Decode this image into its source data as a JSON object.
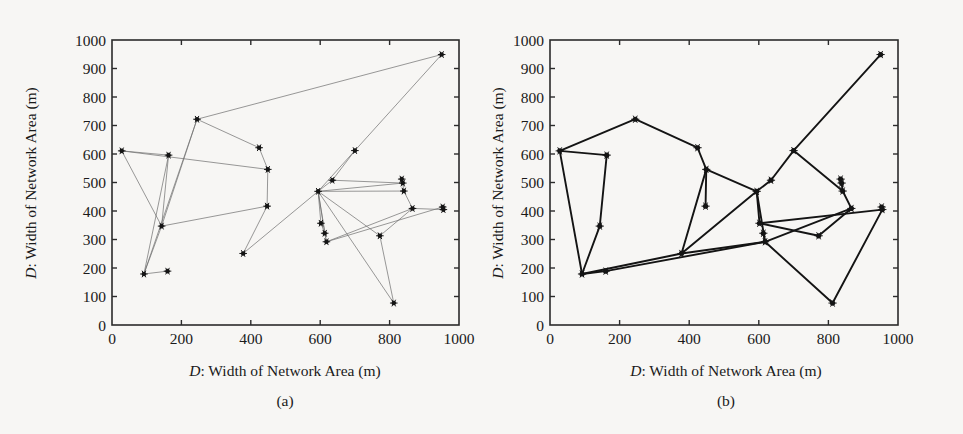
{
  "figure": {
    "background_color": "#f7f6f4",
    "ink_color": "#1a1a1a"
  },
  "panels": [
    {
      "id": "a",
      "caption": "(a)",
      "xlabel_prefix": "D",
      "xlabel_rest": ": Width of Network Area (m)",
      "ylabel_prefix": "D",
      "ylabel_rest": ": Width of Network Area (m)",
      "xticks": [
        "0",
        "200",
        "400",
        "600",
        "800",
        "1000"
      ],
      "yticks": [
        "0",
        "100",
        "200",
        "300",
        "400",
        "500",
        "600",
        "700",
        "800",
        "900",
        "1000"
      ]
    },
    {
      "id": "b",
      "caption": "(b)",
      "xlabel_prefix": "D",
      "xlabel_rest": ": Width of Network Area (m)",
      "ylabel_prefix": "D",
      "ylabel_rest": ": Width of Network Area (m)",
      "xticks": [
        "0",
        "200",
        "400",
        "600",
        "800",
        "1000"
      ],
      "yticks": [
        "0",
        "100",
        "200",
        "300",
        "400",
        "500",
        "600",
        "700",
        "800",
        "900",
        "1000"
      ]
    }
  ],
  "chart_data": [
    {
      "type": "scatter",
      "panel": "a",
      "title": "(a)",
      "xlabel": "D: Width of Network Area (m)",
      "ylabel": "D: Width of Network Area (m)",
      "xlim": [
        0,
        1000
      ],
      "ylim": [
        0,
        1000
      ],
      "xticks": [
        0,
        200,
        400,
        600,
        800,
        1000
      ],
      "yticks": [
        0,
        100,
        200,
        300,
        400,
        500,
        600,
        700,
        800,
        900,
        1000
      ],
      "grid": false,
      "legend": null,
      "marker": "star-dot",
      "edge_style": "thin-gray",
      "nodes": [
        {
          "id": 0,
          "x": 28,
          "y": 611
        },
        {
          "id": 1,
          "x": 163,
          "y": 596
        },
        {
          "id": 2,
          "x": 143,
          "y": 347
        },
        {
          "id": 3,
          "x": 92,
          "y": 179
        },
        {
          "id": 4,
          "x": 160,
          "y": 189
        },
        {
          "id": 5,
          "x": 245,
          "y": 722
        },
        {
          "id": 6,
          "x": 424,
          "y": 622
        },
        {
          "id": 7,
          "x": 449,
          "y": 546
        },
        {
          "id": 8,
          "x": 447,
          "y": 417
        },
        {
          "id": 9,
          "x": 378,
          "y": 251
        },
        {
          "id": 10,
          "x": 594,
          "y": 469
        },
        {
          "id": 11,
          "x": 635,
          "y": 508
        },
        {
          "id": 12,
          "x": 700,
          "y": 612
        },
        {
          "id": 13,
          "x": 835,
          "y": 512
        },
        {
          "id": 14,
          "x": 838,
          "y": 498
        },
        {
          "id": 15,
          "x": 841,
          "y": 470
        },
        {
          "id": 16,
          "x": 953,
          "y": 414
        },
        {
          "id": 17,
          "x": 955,
          "y": 405
        },
        {
          "id": 18,
          "x": 866,
          "y": 409
        },
        {
          "id": 19,
          "x": 772,
          "y": 313
        },
        {
          "id": 20,
          "x": 602,
          "y": 357
        },
        {
          "id": 21,
          "x": 613,
          "y": 322
        },
        {
          "id": 22,
          "x": 618,
          "y": 292
        },
        {
          "id": 23,
          "x": 812,
          "y": 77
        },
        {
          "id": 24,
          "x": 950,
          "y": 949
        }
      ],
      "edges": [
        [
          0,
          1
        ],
        [
          0,
          2
        ],
        [
          0,
          7
        ],
        [
          1,
          3
        ],
        [
          1,
          2
        ],
        [
          2,
          3
        ],
        [
          2,
          8
        ],
        [
          3,
          4
        ],
        [
          5,
          24
        ],
        [
          5,
          3
        ],
        [
          5,
          2
        ],
        [
          5,
          6
        ],
        [
          6,
          7
        ],
        [
          7,
          8
        ],
        [
          8,
          9
        ],
        [
          9,
          10
        ],
        [
          10,
          11
        ],
        [
          10,
          12
        ],
        [
          10,
          14
        ],
        [
          10,
          15
        ],
        [
          10,
          19
        ],
        [
          10,
          20
        ],
        [
          10,
          21
        ],
        [
          10,
          22
        ],
        [
          10,
          23
        ],
        [
          11,
          12
        ],
        [
          11,
          14
        ],
        [
          12,
          24
        ],
        [
          13,
          14
        ],
        [
          14,
          15
        ],
        [
          15,
          18
        ],
        [
          16,
          17
        ],
        [
          17,
          18
        ],
        [
          18,
          19
        ],
        [
          18,
          22
        ],
        [
          19,
          23
        ],
        [
          20,
          21
        ],
        [
          21,
          22
        ],
        [
          22,
          16
        ]
      ]
    },
    {
      "type": "scatter",
      "panel": "b",
      "title": "(b)",
      "xlabel": "D: Width of Network Area (m)",
      "ylabel": "D: Width of Network Area (m)",
      "xlim": [
        0,
        1000
      ],
      "ylim": [
        0,
        1000
      ],
      "xticks": [
        0,
        200,
        400,
        600,
        800,
        1000
      ],
      "yticks": [
        0,
        100,
        200,
        300,
        400,
        500,
        600,
        700,
        800,
        900,
        1000
      ],
      "grid": false,
      "legend": null,
      "marker": "star-dot",
      "edge_style": "thick-black",
      "nodes": [
        {
          "id": 0,
          "x": 28,
          "y": 611
        },
        {
          "id": 1,
          "x": 163,
          "y": 596
        },
        {
          "id": 2,
          "x": 143,
          "y": 347
        },
        {
          "id": 3,
          "x": 92,
          "y": 179
        },
        {
          "id": 4,
          "x": 160,
          "y": 189
        },
        {
          "id": 5,
          "x": 245,
          "y": 722
        },
        {
          "id": 6,
          "x": 424,
          "y": 622
        },
        {
          "id": 7,
          "x": 449,
          "y": 546
        },
        {
          "id": 8,
          "x": 447,
          "y": 417
        },
        {
          "id": 9,
          "x": 378,
          "y": 251
        },
        {
          "id": 10,
          "x": 594,
          "y": 469
        },
        {
          "id": 11,
          "x": 635,
          "y": 508
        },
        {
          "id": 12,
          "x": 700,
          "y": 612
        },
        {
          "id": 13,
          "x": 835,
          "y": 512
        },
        {
          "id": 14,
          "x": 838,
          "y": 498
        },
        {
          "id": 15,
          "x": 841,
          "y": 470
        },
        {
          "id": 16,
          "x": 953,
          "y": 414
        },
        {
          "id": 17,
          "x": 955,
          "y": 405
        },
        {
          "id": 18,
          "x": 866,
          "y": 409
        },
        {
          "id": 19,
          "x": 772,
          "y": 313
        },
        {
          "id": 20,
          "x": 602,
          "y": 357
        },
        {
          "id": 21,
          "x": 613,
          "y": 322
        },
        {
          "id": 22,
          "x": 618,
          "y": 292
        },
        {
          "id": 23,
          "x": 812,
          "y": 77
        },
        {
          "id": 24,
          "x": 950,
          "y": 949
        }
      ],
      "edges": [
        [
          0,
          1
        ],
        [
          0,
          5
        ],
        [
          0,
          3
        ],
        [
          1,
          2
        ],
        [
          2,
          3
        ],
        [
          3,
          4
        ],
        [
          3,
          9
        ],
        [
          4,
          22
        ],
        [
          5,
          6
        ],
        [
          6,
          7
        ],
        [
          7,
          8
        ],
        [
          7,
          9
        ],
        [
          7,
          10
        ],
        [
          9,
          10
        ],
        [
          9,
          22
        ],
        [
          10,
          11
        ],
        [
          10,
          20
        ],
        [
          10,
          22
        ],
        [
          11,
          12
        ],
        [
          12,
          15
        ],
        [
          12,
          24
        ],
        [
          13,
          14
        ],
        [
          14,
          15
        ],
        [
          15,
          18
        ],
        [
          16,
          17
        ],
        [
          17,
          23
        ],
        [
          17,
          20
        ],
        [
          18,
          19
        ],
        [
          18,
          22
        ],
        [
          19,
          20
        ],
        [
          21,
          22
        ],
        [
          22,
          23
        ]
      ]
    }
  ]
}
